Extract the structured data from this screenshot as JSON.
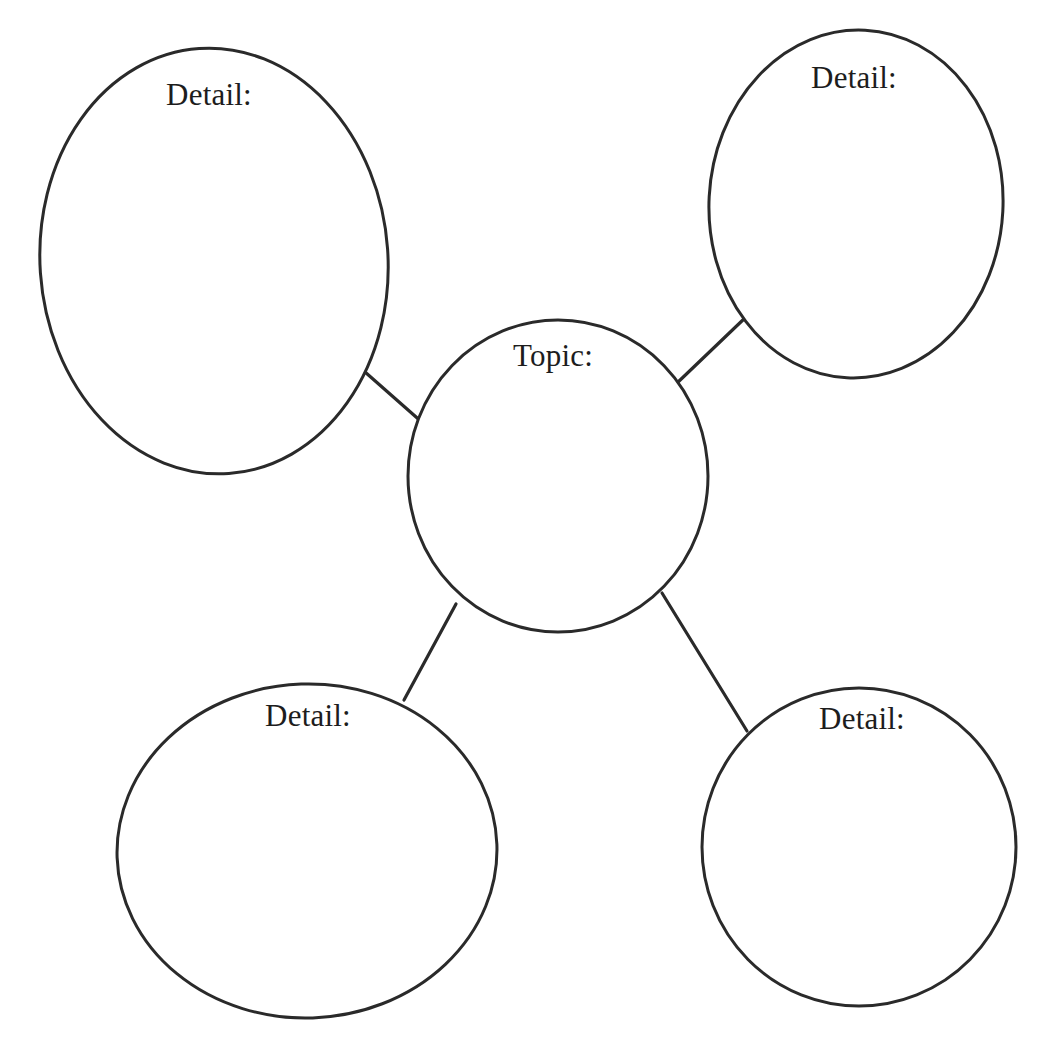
{
  "document": {
    "kind": "web-graphic-organizer",
    "background_color": "#ffffff",
    "stroke_color": "#2a2a2a",
    "text_color": "#1d1d1d",
    "width": 1051,
    "height": 1059
  },
  "center": {
    "label": "Topic:",
    "label_x": 553,
    "label_y": 366,
    "cx": 558,
    "cy": 476,
    "rx": 150,
    "ry": 156,
    "rotation": 0
  },
  "details": [
    {
      "id": "detail-top-left",
      "label": "Detail:",
      "label_x": 209,
      "label_y": 105,
      "cx": 214,
      "cy": 261,
      "rx": 174,
      "ry": 213,
      "rotation": -4
    },
    {
      "id": "detail-top-right",
      "label": "Detail:",
      "label_x": 854,
      "label_y": 88,
      "cx": 856,
      "cy": 204,
      "rx": 147,
      "ry": 174,
      "rotation": 3
    },
    {
      "id": "detail-bottom-left",
      "label": "Detail:",
      "label_x": 308,
      "label_y": 726,
      "cx": 307,
      "cy": 851,
      "rx": 190,
      "ry": 167,
      "rotation": -2
    },
    {
      "id": "detail-bottom-right",
      "label": "Detail:",
      "label_x": 862,
      "label_y": 729,
      "cx": 859,
      "cy": 847,
      "rx": 157,
      "ry": 159,
      "rotation": 0
    }
  ],
  "connectors": [
    {
      "id": "connector-top-left",
      "x1": 365,
      "y1": 372,
      "x2": 424,
      "y2": 424
    },
    {
      "id": "connector-top-right",
      "x1": 676,
      "y1": 384,
      "x2": 746,
      "y2": 317
    },
    {
      "id": "connector-bottom-left",
      "x1": 456,
      "y1": 604,
      "x2": 404,
      "y2": 700
    },
    {
      "id": "connector-bottom-right",
      "x1": 662,
      "y1": 593,
      "x2": 747,
      "y2": 731
    }
  ]
}
